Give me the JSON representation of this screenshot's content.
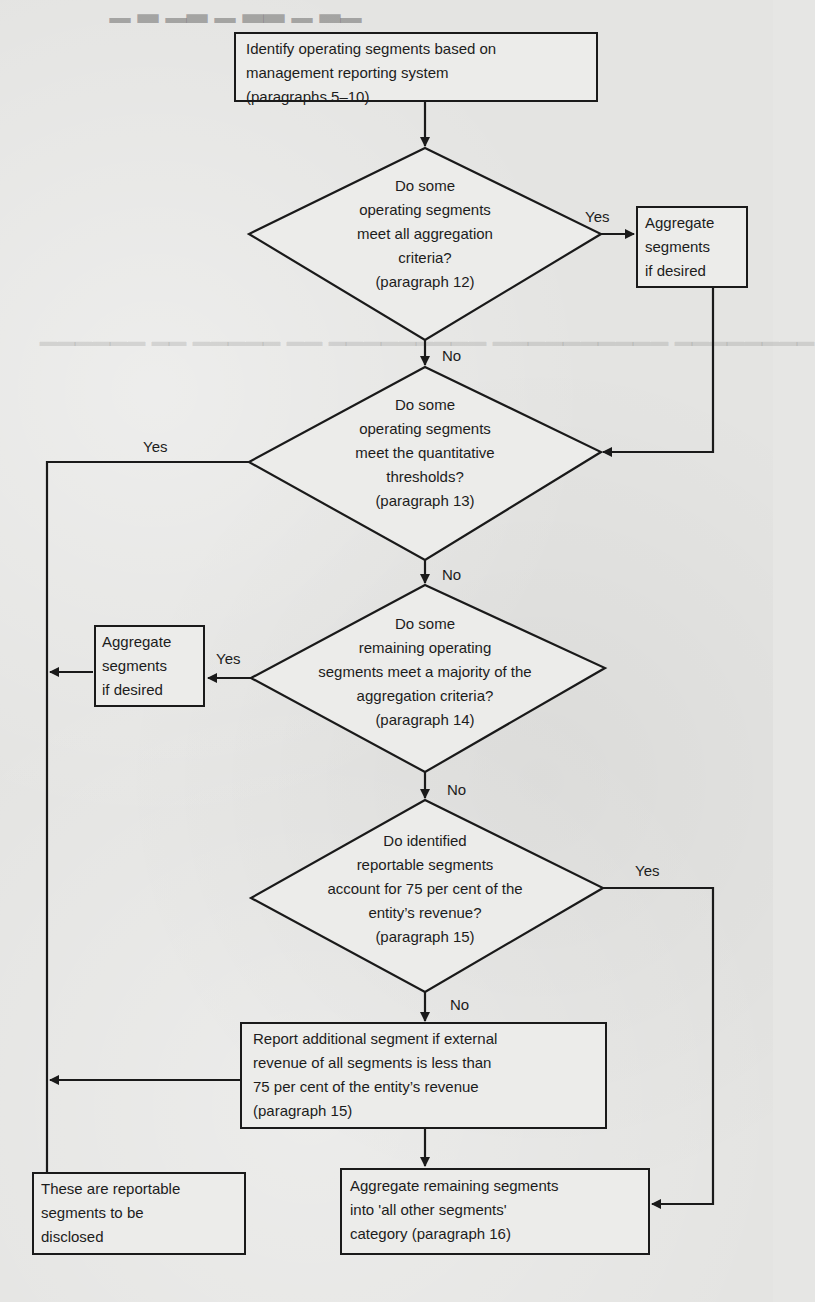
{
  "flowchart": {
    "start": {
      "lines": [
        "Identify operating segments based on",
        "management reporting system",
        "(paragraphs 5–10)"
      ]
    },
    "decision1": {
      "lines": [
        "Do some",
        "operating segments",
        "meet all aggregation",
        "criteria?",
        "(paragraph 12)"
      ],
      "yes_label": "Yes",
      "no_label": "No"
    },
    "aggregate1": {
      "lines": [
        "Aggregate",
        "segments",
        "if desired"
      ]
    },
    "decision2": {
      "lines": [
        "Do some",
        "operating segments",
        "meet the quantitative",
        "thresholds?",
        "(paragraph 13)"
      ],
      "yes_label": "Yes",
      "no_label": "No"
    },
    "decision3": {
      "lines": [
        "Do some",
        "remaining operating",
        "segments meet a majority of the",
        "aggregation criteria?",
        "(paragraph 14)"
      ],
      "yes_label": "Yes",
      "no_label": "No"
    },
    "aggregate2": {
      "lines": [
        "Aggregate",
        "segments",
        "if desired"
      ]
    },
    "decision4": {
      "lines": [
        "Do identified",
        "reportable segments",
        "account for 75 per cent of the",
        "entity’s revenue?",
        "(paragraph 15)"
      ],
      "yes_label": "Yes",
      "no_label": "No"
    },
    "report_additional": {
      "lines": [
        "Report additional segment if external",
        "revenue of all segments is less than",
        "75 per cent of the entity’s revenue",
        "(paragraph 15)"
      ]
    },
    "reportable": {
      "lines": [
        "These are reportable",
        "segments to be",
        "disclosed"
      ]
    },
    "all_other": {
      "lines": [
        "Aggregate remaining segments",
        "into 'all other segments'",
        "category (paragraph 16)"
      ]
    }
  },
  "colors": {
    "paper": "#e4e4e2",
    "ink": "#1a1a1a"
  }
}
